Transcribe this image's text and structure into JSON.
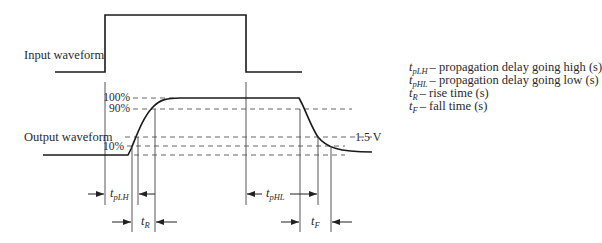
{
  "labels": {
    "input_waveform": "Input waveform",
    "output_waveform": "Output waveform"
  },
  "levels": {
    "pct_100": "100%",
    "pct_90": "90%",
    "pct_10": "10%",
    "threshold": "1.5 V"
  },
  "timing_symbols": {
    "tpLH": {
      "base": "t",
      "sub": "pLH"
    },
    "tpHL": {
      "base": "t",
      "sub": "pHL"
    },
    "tR": {
      "base": "t",
      "sub": "R"
    },
    "tF": {
      "base": "t",
      "sub": "F"
    }
  },
  "legend": [
    {
      "base": "t",
      "sub": "pLH",
      "text": "– propagation delay going high (s)"
    },
    {
      "base": "t",
      "sub": "pHL",
      "text": "– propagation delay going low (s)"
    },
    {
      "base": "t",
      "sub": "R",
      "text": "– rise time (s)"
    },
    {
      "base": "t",
      "sub": "F",
      "text": "– fall time (s)"
    }
  ],
  "colors": {
    "waveform": "#1a1a1a",
    "guide": "#444444",
    "dashed": "#555555"
  }
}
